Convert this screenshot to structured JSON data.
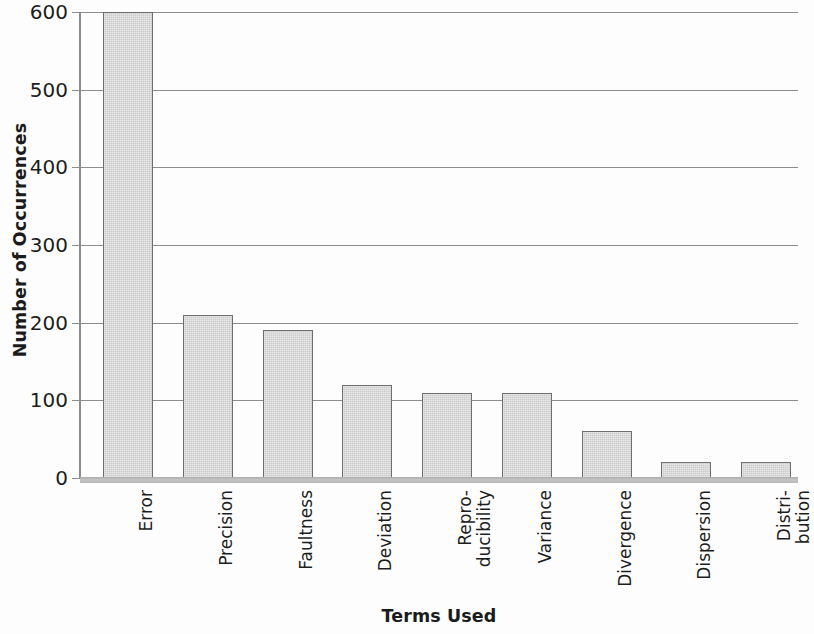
{
  "chart_data": {
    "type": "bar",
    "title": "",
    "xlabel": "Terms Used",
    "ylabel": "Number of Occurrences",
    "categories": [
      "Error",
      "Precision",
      "Faultness",
      "Deviation",
      "Repro-ducibility",
      "Variance",
      "Divergence",
      "Dispersion",
      "Distri-bution"
    ],
    "category_lines": [
      [
        "Error"
      ],
      [
        "Precision"
      ],
      [
        "Faultness"
      ],
      [
        "Deviation"
      ],
      [
        "Repro-",
        "ducibility"
      ],
      [
        "Variance"
      ],
      [
        "Divergence"
      ],
      [
        "Dispersion"
      ],
      [
        "Distri-",
        "bution"
      ]
    ],
    "values": [
      600,
      210,
      190,
      120,
      110,
      110,
      60,
      20,
      20
    ],
    "ylim": [
      0,
      600
    ],
    "yticks": [
      0,
      100,
      200,
      300,
      400,
      500,
      600
    ],
    "ytick_labels": [
      "0",
      "100",
      "200",
      "300",
      "400",
      "500",
      "600"
    ],
    "grid": true,
    "legend": false,
    "legend_position": "none",
    "bar_fill_color": "#cdcdcd",
    "bar_edge_color": "#6f6f6f",
    "gridline_color": "#8d8d8d",
    "axis_color": "#8d8d8d",
    "background_color": "#fdfdfd",
    "text_color": "#1d1d1d"
  }
}
